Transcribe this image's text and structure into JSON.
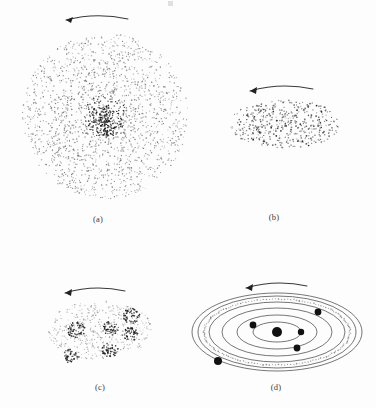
{
  "figure": {
    "background_color": "#fdfdfd",
    "ink_color": "#3b3b3b",
    "dot_color": "#6d6d6d",
    "dense_dot_color": "#1b1b1b",
    "body_color": "#111111"
  },
  "panels": [
    {
      "id": "a",
      "label": "(a)",
      "kind": "dot-cloud-circular",
      "center": [
        105,
        116
      ],
      "radius": 83,
      "dot_count": 1850,
      "center_concentration": "high",
      "arrow": {
        "direction": "left",
        "style": "curved",
        "from": [
          128,
          18
        ],
        "to": [
          64,
          21
        ]
      }
    },
    {
      "id": "b",
      "label": "(b)",
      "kind": "dot-cloud-ellipse",
      "center": [
        285,
        124
      ],
      "rx": 56,
      "ry": 24,
      "dot_count": 470,
      "center_concentration": "low",
      "arrow": {
        "direction": "left",
        "style": "curved",
        "from": [
          313,
          88
        ],
        "to": [
          248,
          93
        ]
      }
    },
    {
      "id": "c",
      "label": "(c)",
      "kind": "dot-cloud-ellipse-clumped",
      "center": [
        100,
        330
      ],
      "rx": 52,
      "ry": 30,
      "dot_count": 430,
      "clumps": [
        {
          "cx": 76,
          "cy": 330,
          "r": 9,
          "count": 62
        },
        {
          "cx": 111,
          "cy": 328,
          "r": 8,
          "count": 55
        },
        {
          "cx": 131,
          "cy": 316,
          "r": 9,
          "count": 60
        },
        {
          "cx": 130,
          "cy": 334,
          "r": 8,
          "count": 52
        },
        {
          "cx": 110,
          "cy": 350,
          "r": 8,
          "count": 52
        },
        {
          "cx": 71,
          "cy": 356,
          "r": 8,
          "count": 50
        }
      ],
      "arrow": {
        "direction": "left",
        "style": "curved",
        "from": [
          125,
          290
        ],
        "to": [
          63,
          294
        ]
      }
    },
    {
      "id": "d",
      "label": "(d)",
      "kind": "orbital-system",
      "center": [
        277,
        332
      ],
      "orbits": [
        {
          "rx": 24,
          "ry": 10
        },
        {
          "rx": 40,
          "ry": 17
        },
        {
          "rx": 55,
          "ry": 24
        },
        {
          "rx": 68,
          "ry": 30
        },
        {
          "rx": 79,
          "ry": 36
        }
      ],
      "dotted_ring": {
        "rx": 73,
        "ry": 33,
        "dot_count": 150
      },
      "central_body": {
        "cx": 277,
        "cy": 332,
        "r": 5.0
      },
      "planets": [
        {
          "cx": 253,
          "cy": 325,
          "r": 3.4
        },
        {
          "cx": 301,
          "cy": 332,
          "r": 3.2
        },
        {
          "cx": 297,
          "cy": 348,
          "r": 3.4
        },
        {
          "cx": 318,
          "cy": 312,
          "r": 3.4
        },
        {
          "cx": 218,
          "cy": 361,
          "r": 4.0
        }
      ],
      "arrow": {
        "direction": "left",
        "style": "curved",
        "from": [
          307,
          285
        ],
        "to": [
          244,
          289
        ]
      }
    }
  ],
  "caption_labels": [
    "(a)",
    "(b)",
    "(c)",
    "(d)"
  ]
}
